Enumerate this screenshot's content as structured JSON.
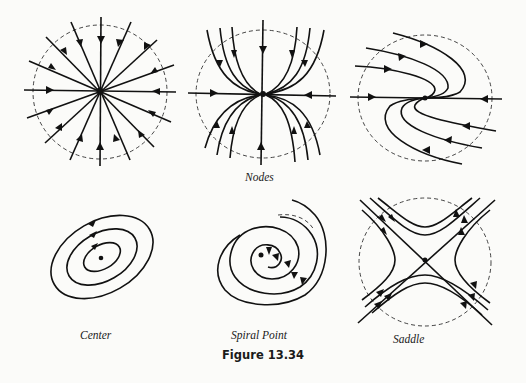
{
  "figure": {
    "caption": "Figure 13.34",
    "panels": [
      {
        "id": "node-star",
        "type": "star node (proper node)",
        "label": ""
      },
      {
        "id": "node-improper",
        "type": "improper node",
        "label": ""
      },
      {
        "id": "node-degenerate",
        "type": "degenerate node",
        "label": ""
      },
      {
        "id": "center",
        "type": "center",
        "label": "Center"
      },
      {
        "id": "spiral",
        "type": "spiral point",
        "label": "Spiral Point"
      },
      {
        "id": "saddle",
        "type": "saddle point",
        "label": "Saddle"
      }
    ],
    "group_label": "Nodes"
  },
  "colors": {
    "ink": "#111111",
    "background": "#fbfbf9",
    "dashed_circle": "#444444"
  }
}
